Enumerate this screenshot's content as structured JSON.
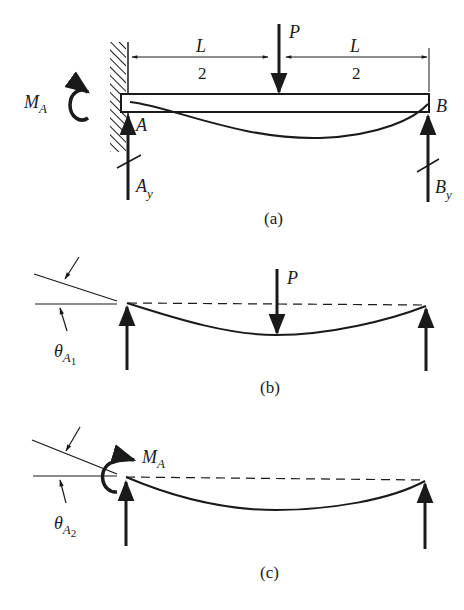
{
  "figure": {
    "panels": [
      {
        "id": "a",
        "caption": "(a)",
        "description": "Propped cantilever beam: fixed at A, roller support at B, point load P at midspan",
        "labels": {
          "load": "P",
          "span_left_num": "L",
          "span_left_den": "2",
          "span_right_num": "L",
          "span_right_den": "2",
          "moment_main": "M",
          "moment_sub": "A",
          "support_a": "A",
          "support_b": "B",
          "reaction_a_main": "A",
          "reaction_a_sub": "y",
          "reaction_b_main": "B",
          "reaction_b_sub": "y"
        }
      },
      {
        "id": "b",
        "caption": "(b)",
        "description": "Simply supported beam with load P at midspan, rotation at A",
        "labels": {
          "load": "P",
          "theta_main": "θ",
          "theta_sub": "A",
          "theta_subsub": "1"
        }
      },
      {
        "id": "c",
        "caption": "(c)",
        "description": "Simply supported beam with moment M_A applied at A, rotation at A",
        "labels": {
          "moment_main": "M",
          "moment_sub": "A",
          "theta_main": "θ",
          "theta_sub": "A",
          "theta_subsub": "2"
        }
      }
    ]
  },
  "colors": {
    "ink": "#1a1a1a",
    "paper": "#ffffff"
  }
}
